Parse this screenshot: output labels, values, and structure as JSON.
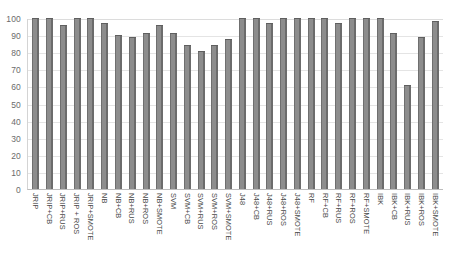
{
  "chart_data": {
    "type": "bar",
    "title": "",
    "subtitle": "",
    "xlabel": "",
    "ylabel": "",
    "ylim": [
      0,
      100
    ],
    "yticks": [
      0,
      10,
      20,
      30,
      40,
      50,
      60,
      70,
      80,
      90,
      100
    ],
    "ytick_labels": [
      "0",
      "10",
      "20",
      "30",
      "40",
      "50",
      "60",
      "70",
      "80",
      "90",
      "100"
    ],
    "grid": true,
    "legend": "none",
    "bar_color": "#808080",
    "categories": [
      "JRIP",
      "JRIP+CB",
      "JRIP+RUS",
      "JRIP + ROS",
      "JRIP+SMOTE",
      "NB",
      "NB+CB",
      "NB+RUS",
      "NB+ROS",
      "NB+SMOTE",
      "SVM",
      "SVM+CB",
      "SVM+RUS",
      "SVM+ROS",
      "SVM+SMOTE",
      "J48",
      "J48+CB",
      "J48+RUS",
      "J48+ROS",
      "J48+SMOTE",
      "RF",
      "RF+CB",
      "RF+RUS",
      "RF+ROS",
      "RF+SMOTE",
      "IBK",
      "IBK+CB",
      "IBK+RUS",
      "IBK+ROS",
      "IBK+SMOTE"
    ],
    "values": [
      100,
      100,
      96,
      100,
      100,
      97,
      90,
      89,
      91,
      96,
      91,
      84,
      81,
      84,
      88,
      100,
      100,
      97,
      100,
      100,
      100,
      100,
      97,
      100,
      100,
      100,
      91,
      61,
      89,
      98
    ]
  }
}
